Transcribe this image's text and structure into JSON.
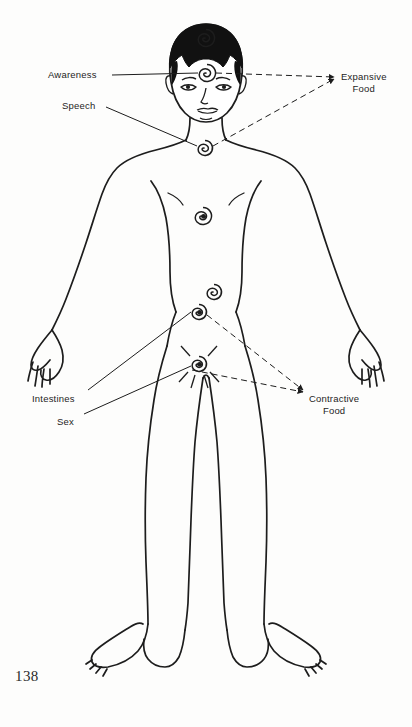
{
  "page": {
    "page_number": "138",
    "background_color": "#fdfdfc",
    "ink_color": "#1d1d1d"
  },
  "diagram": {
    "labels": [
      {
        "id": "awareness",
        "text": "Awareness",
        "side": "left",
        "x": 48,
        "y": 69,
        "line_style": "solid"
      },
      {
        "id": "speech",
        "text": "Speech",
        "side": "left",
        "x": 62,
        "y": 100,
        "line_style": "solid"
      },
      {
        "id": "expansive-food",
        "text": "Expansive\nFood",
        "side": "right",
        "x": 341,
        "y": 71,
        "line_style": "dashed"
      },
      {
        "id": "intestines",
        "text": "Intestines",
        "side": "left",
        "x": 32,
        "y": 393,
        "line_style": "solid"
      },
      {
        "id": "sex",
        "text": "Sex",
        "side": "left",
        "x": 57,
        "y": 416,
        "line_style": "solid"
      },
      {
        "id": "contractive-food",
        "text": "Contractive\nFood",
        "side": "right",
        "x": 309,
        "y": 393,
        "line_style": "dashed"
      }
    ],
    "chakras": [
      {
        "id": "crown",
        "x": 206,
        "y": 38,
        "radius": 9,
        "rays": false
      },
      {
        "id": "third-eye",
        "x": 207,
        "y": 73,
        "radius": 9,
        "rays": false
      },
      {
        "id": "throat",
        "x": 205,
        "y": 148,
        "radius": 8,
        "rays": false
      },
      {
        "id": "heart",
        "x": 203,
        "y": 216,
        "radius": 9,
        "rays": false
      },
      {
        "id": "navel",
        "x": 214,
        "y": 292,
        "radius": 8,
        "rays": false
      },
      {
        "id": "intestines",
        "x": 199,
        "y": 312,
        "radius": 8,
        "rays": false
      },
      {
        "id": "sex",
        "x": 199,
        "y": 364,
        "radius": 8,
        "rays": true
      }
    ],
    "leader_lines": [
      {
        "from": "awareness",
        "to": "third-eye",
        "style": "solid"
      },
      {
        "from": "speech",
        "to": "throat",
        "style": "solid"
      },
      {
        "from": "third-eye",
        "to": "expansive-food",
        "style": "dashed"
      },
      {
        "from": "throat",
        "to": "expansive-food",
        "style": "dashed"
      },
      {
        "from": "intestines-label",
        "to": "intestines",
        "style": "solid"
      },
      {
        "from": "sex-label",
        "to": "sex",
        "style": "solid"
      },
      {
        "from": "intestines",
        "to": "contractive-food",
        "style": "dashed"
      },
      {
        "from": "sex",
        "to": "contractive-food",
        "style": "dashed"
      }
    ]
  }
}
